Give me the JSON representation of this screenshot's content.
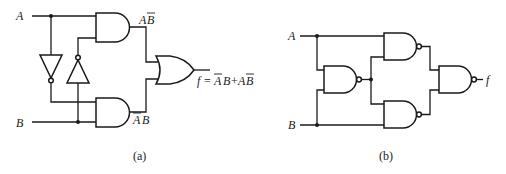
{
  "diagram_a": {
    "caption": "(a)",
    "inputs": {
      "a": "A",
      "b": "B"
    },
    "gate_labels": {
      "and_top": "A",
      "and_top_bar": "B",
      "and_bottom_bar": "A",
      "and_bottom": "B"
    },
    "output": {
      "prefix": "f =",
      "term1_bar": "A",
      "term1": "B",
      "plus": "+",
      "term2": "A",
      "term2_bar": "B"
    },
    "gates": [
      "NOT",
      "NOT",
      "AND",
      "AND",
      "OR"
    ]
  },
  "diagram_b": {
    "caption": "(b)",
    "inputs": {
      "a": "A",
      "b": "B"
    },
    "output": "f",
    "gates": [
      "NAND",
      "NAND",
      "NAND",
      "NAND"
    ]
  }
}
